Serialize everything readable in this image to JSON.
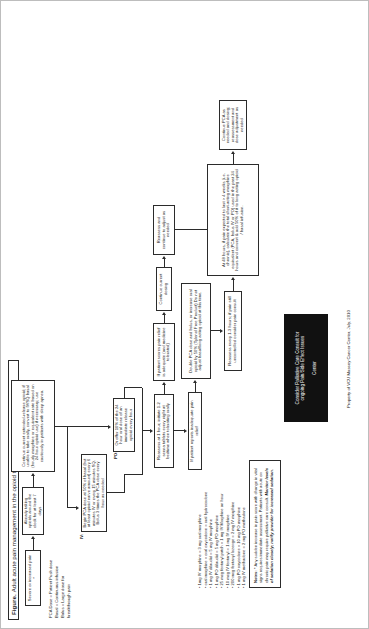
{
  "figure": {
    "label": "Figure.",
    "title": "Adult acute pain management in the opioid tolerant patient"
  },
  "key": {
    "lines": [
      "PCA Dose = Patient Push dose",
      "Basal = Continuous infusion",
      "Bolus = Large dose for",
      "breakthrough pain"
    ]
  },
  "route_labels": {
    "iv": "IV:",
    "po": "PO:"
  },
  "boxes": {
    "start": "Severe or increased pain *",
    "already_taking": "Already taking opioids around the clock for at least 7 days",
    "continue_current": "Continue current extended-release opioid; if unable to take orally, convert to IV/SQ basal (hourly morphine or equivalent rate based on 24 hour opioid use) if necessary; use cautiously in patients with sleep apnea.",
    "begin_pca": "Begin PCA dose at 50% of basal (but at least opioid naïve amount) every 6 minutes IV or every 15 minutes SQ.  Bolus 3 times the PCA dose every hour as needed",
    "or_offer": "Or offer 10% of the 24 hour oral dose of an immediate release opioid every hour",
    "reassess_1hr": "Reassess at 1 hour; initiate 1-2 senna tablets every night at bedtime when tolerating orally",
    "inadequate": "If patient reports inadequate pain relief",
    "double_pca": "Double PCA dose and bolus, or increase oral opioid by 50% (Tylenol Free Product) Do not adjust basal/long acting opioid at this time.",
    "scores_adequate": "If patient scores pain relief is adequate (and medicine tolerated)",
    "continue_dosing": "Continue current dosing",
    "reassess_adjust": "Reassess and continue to adjust as needed",
    "reassess_1to3": "Reassess every 1-3 hours; if pain still uncontrolled consider pain consult",
    "at_48_hours": "At 48 hours, if pain expected to last > 4 weeks (i.e. chronic), calculate the total short-acting morphine equivalent (PCA, bolus IV or PO) used in the past 24 hours and convert & add 50% of it to long acting opioid / basal infusion.",
    "continue_prn": "Continue PCA as needed and dosing; reassessment and dose adjustment as needed"
  },
  "conversions": {
    "items": [
      "1mg IV morphine = 3 mg oral morphine",
      "oral morphine = oral oxycodone = oral hydrocodone",
      "1 mg IV dilaudid = 5 mg IV morphine",
      "1 mg PO dilaudid = 5 mg PO morphine",
      "25 mcg fentanyl patch = 1 mg IV Morphine an hour",
      "10 mcg IV fentanyl = 1 mg IV morphine",
      "200 mcg fentanyl lozenge = 2 mg IV morphine",
      "1 mg PO oxycodone = 10 mg PO morphine",
      "1 mg IV methadone = 2 mg PO methadone"
    ]
  },
  "notes": {
    "heading": "Notes:",
    "body": "* Any sudden increase in pain score with change in vital signs requires immediate assessment. Patients with acute on chronic pain may require palliative care consult.",
    "emphasis": "Monitor levels of sedation closely; notify provider for increased sedation."
  },
  "palliative": {
    "line1": "Consider Palliative Care Consult for",
    "line2": "ongoing Pain/Side Effect Issues",
    "line3": "Center",
    "bg": "#111111",
    "fg": "#ffffff"
  },
  "credit": "Property of VCU Massey Cancer Center, July, 2010"
}
